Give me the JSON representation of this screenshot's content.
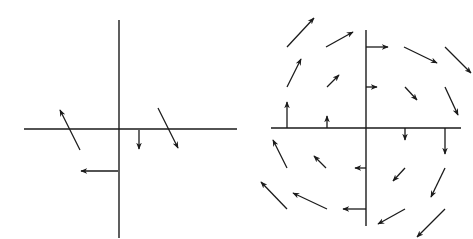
{
  "figure": {
    "width": 473,
    "height": 239,
    "background": "#ffffff",
    "stroke": "#1a1a1a"
  },
  "panels": [
    {
      "name": "left-vector-field",
      "axes": {
        "vertical": [
          119,
          20,
          119,
          238
        ],
        "horizontal": [
          24,
          129,
          237,
          129
        ]
      },
      "arrows": [
        [
          80,
          150,
          60,
          110
        ],
        [
          158,
          108,
          178,
          148
        ],
        [
          139,
          130,
          139,
          149
        ],
        [
          118,
          171,
          81,
          171
        ]
      ]
    },
    {
      "name": "right-vector-field",
      "axes": {
        "vertical": [
          366,
          30,
          366,
          226
        ],
        "horizontal": [
          271,
          128,
          461,
          128
        ]
      },
      "arrows": [
        [
          287,
          47,
          314,
          18
        ],
        [
          326,
          47,
          353,
          32
        ],
        [
          366,
          47,
          388,
          47
        ],
        [
          404,
          47,
          437,
          63
        ],
        [
          445,
          47,
          471,
          73
        ],
        [
          287,
          87,
          301,
          59
        ],
        [
          327,
          87,
          339,
          75
        ],
        [
          366,
          87,
          377,
          87
        ],
        [
          405,
          87,
          417,
          100
        ],
        [
          445,
          87,
          458,
          115
        ],
        [
          287,
          128,
          287,
          102
        ],
        [
          327,
          128,
          327,
          116
        ],
        [
          405,
          128,
          405,
          140
        ],
        [
          445,
          128,
          445,
          154
        ],
        [
          287,
          168,
          273,
          140
        ],
        [
          326,
          168,
          314,
          156
        ],
        [
          366,
          168,
          355,
          168
        ],
        [
          405,
          168,
          393,
          181
        ],
        [
          445,
          168,
          431,
          197
        ],
        [
          287,
          209,
          261,
          182
        ],
        [
          327,
          209,
          293,
          193
        ],
        [
          366,
          209,
          343,
          209
        ],
        [
          405,
          209,
          378,
          224
        ],
        [
          445,
          209,
          417,
          237
        ]
      ]
    }
  ]
}
